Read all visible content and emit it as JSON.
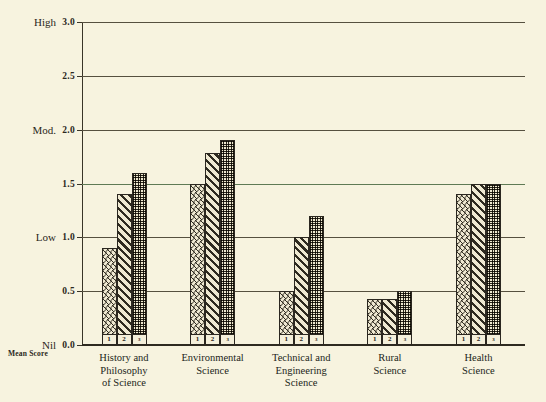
{
  "chart_data": {
    "type": "bar",
    "title": "",
    "xlabel": "",
    "ylabel": "Mean Score",
    "ylim": [
      0.0,
      3.0
    ],
    "ytick_values": [
      "0.0",
      "0.5",
      "1.0",
      "1.5",
      "2.0",
      "2.5",
      "3.0"
    ],
    "band_labels": [
      {
        "text": "Nil",
        "value": 0.0
      },
      {
        "text": "Low",
        "value": 1.0
      },
      {
        "text": "Mod.",
        "value": 2.0
      },
      {
        "text": "High",
        "value": 3.0
      }
    ],
    "grid": true,
    "legend": "none",
    "bar_keys": [
      "1",
      "2",
      "3"
    ],
    "categories": [
      "History and\nPhilosophy\nof Science",
      "Environmental\nScience",
      "Technical and\nEngineering\nScience",
      "Rural\nScience",
      "Health\nScience"
    ],
    "series": [
      {
        "name": "1",
        "values": [
          0.9,
          1.5,
          0.5,
          0.43,
          1.4
        ]
      },
      {
        "name": "2",
        "values": [
          1.4,
          1.78,
          1.0,
          0.43,
          1.5
        ]
      },
      {
        "name": "3",
        "values": [
          1.6,
          1.9,
          1.2,
          0.5,
          1.5
        ]
      }
    ]
  },
  "colors": {
    "background": "#f7f3df",
    "ink": "#2b2720",
    "grid": "#56503f",
    "grid_tinted": "#5f7a55"
  }
}
